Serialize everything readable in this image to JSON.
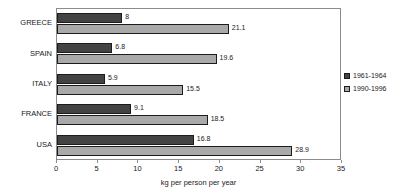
{
  "chart_data": {
    "type": "bar",
    "orientation": "horizontal",
    "title": "",
    "subtitle": "",
    "xlabel": "kg per person per year",
    "ylabel": "",
    "xlim": [
      0,
      35
    ],
    "xticks": [
      0,
      5,
      10,
      15,
      20,
      25,
      30,
      35
    ],
    "xtick_labels": [
      "0",
      "5",
      "10",
      "15",
      "20",
      "25",
      "30",
      "35"
    ],
    "grid": false,
    "legend_position": "right",
    "categories": [
      "GREECE",
      "SPAIN",
      "ITALY",
      "FRANCE",
      "USA"
    ],
    "series": [
      {
        "name": "1961-1964",
        "color": "#434343",
        "values": [
          8,
          6.8,
          5.9,
          9.1,
          16.8
        ],
        "value_labels": [
          "8",
          "6.8",
          "5.9",
          "9.1",
          "16.8"
        ]
      },
      {
        "name": "1990-1996",
        "color": "#a9a9a9",
        "values": [
          21.1,
          19.6,
          15.5,
          18.5,
          28.9
        ],
        "value_labels": [
          "21.1",
          "19.6",
          "15.5",
          "18.5",
          "28.9"
        ]
      }
    ]
  },
  "legend": {
    "entries": [
      {
        "label": "1961-1964",
        "color": "#434343"
      },
      {
        "label": "1990-1996",
        "color": "#a9a9a9"
      }
    ]
  },
  "axis": {
    "x_title": "kg per person per year"
  },
  "colors": {
    "series_1961_1964": "#434343",
    "series_1990_1996": "#a9a9a9",
    "frame": "#8c8c8c",
    "background": "#ffffff",
    "text": "#1a1a1a"
  }
}
